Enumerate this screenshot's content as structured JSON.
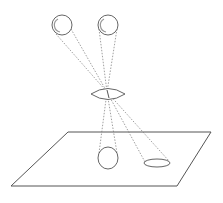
{
  "figure": {
    "colors": {
      "stroke": "#555555",
      "ray": "#777777",
      "shade": "#999999",
      "background": "#ffffff"
    },
    "spheres": [
      {
        "id": "sphere-left",
        "cx": 62,
        "cy": 25,
        "r": 10
      },
      {
        "id": "sphere-right",
        "cx": 108,
        "cy": 25,
        "r": 10
      }
    ],
    "lens": {
      "cx": 108,
      "cy": 94,
      "half_width": 17,
      "half_height": 5
    },
    "focal_point": {
      "x": 107,
      "y": 92
    },
    "ground_plane": {
      "points": [
        [
          68,
          132
        ],
        [
          211,
          132
        ],
        [
          177,
          186
        ],
        [
          11,
          186
        ]
      ]
    },
    "projections": [
      {
        "id": "projection-circle",
        "shape": "circle",
        "cx": 108,
        "cy": 158,
        "rx": 10,
        "ry": 11
      },
      {
        "id": "projection-ellipse",
        "shape": "ellipse",
        "cx": 157,
        "cy": 163,
        "rx": 13,
        "ry": 4
      }
    ],
    "caption": {
      "text": ""
    }
  }
}
